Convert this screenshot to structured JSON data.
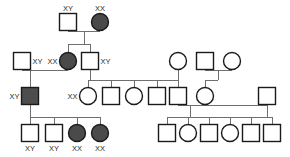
{
  "figure": {
    "kind": "pedigree-chart",
    "width": 290,
    "height": 157,
    "background": "#ffffff",
    "line_color": "#6f6f6f",
    "symbol_outline_color": "#1a1a1a",
    "unaffected_fill": "#ffffff",
    "affected_fill": "#4a4a4a"
  },
  "legend": {
    "square_meaning": "male",
    "circle_meaning": "female",
    "filled_meaning": "affected",
    "open_meaning": "unaffected"
  },
  "generations": [
    {
      "id": "I",
      "individuals": [
        {
          "id": "I-1",
          "shape": "square",
          "sex": "male",
          "affected": false,
          "genotype_label": "XY",
          "label_pos": "above",
          "x": 68,
          "y": 22,
          "size": 17
        },
        {
          "id": "I-2",
          "shape": "circle",
          "sex": "female",
          "affected": true,
          "genotype_label": "XX",
          "label_pos": "above",
          "x": 100,
          "y": 22,
          "size": 17
        }
      ]
    },
    {
      "id": "II",
      "individuals": [
        {
          "id": "II-1",
          "shape": "square",
          "sex": "male",
          "affected": false,
          "genotype_label": "XY",
          "label_pos": "right",
          "x": 22,
          "y": 61,
          "size": 17
        },
        {
          "id": "II-2",
          "shape": "circle",
          "sex": "female",
          "affected": true,
          "genotype_label": "XX",
          "label_pos": "left",
          "x": 68,
          "y": 61,
          "size": 17
        },
        {
          "id": "II-3",
          "shape": "square",
          "sex": "male",
          "affected": false,
          "genotype_label": "XY",
          "label_pos": "right",
          "x": 90,
          "y": 61,
          "size": 17
        },
        {
          "id": "II-4",
          "shape": "circle",
          "sex": "female",
          "affected": false,
          "genotype_label": "",
          "label_pos": "none",
          "x": 178,
          "y": 61,
          "size": 17
        },
        {
          "id": "II-5",
          "shape": "square",
          "sex": "male",
          "affected": false,
          "genotype_label": "",
          "label_pos": "none",
          "x": 205,
          "y": 61,
          "size": 17
        },
        {
          "id": "II-6",
          "shape": "circle",
          "sex": "female",
          "affected": false,
          "genotype_label": "",
          "label_pos": "none",
          "x": 232,
          "y": 61,
          "size": 17
        }
      ]
    },
    {
      "id": "III",
      "individuals": [
        {
          "id": "III-1",
          "shape": "square",
          "sex": "male",
          "affected": true,
          "genotype_label": "XY",
          "label_pos": "left",
          "x": 30,
          "y": 96,
          "size": 17
        },
        {
          "id": "III-2",
          "shape": "circle",
          "sex": "female",
          "affected": false,
          "genotype_label": "XX",
          "label_pos": "left",
          "x": 88,
          "y": 96,
          "size": 17
        },
        {
          "id": "III-3",
          "shape": "square",
          "sex": "male",
          "affected": false,
          "genotype_label": "",
          "label_pos": "none",
          "x": 111,
          "y": 96,
          "size": 17
        },
        {
          "id": "III-4",
          "shape": "circle",
          "sex": "female",
          "affected": false,
          "genotype_label": "",
          "label_pos": "none",
          "x": 134,
          "y": 96,
          "size": 17
        },
        {
          "id": "III-5",
          "shape": "square",
          "sex": "male",
          "affected": false,
          "genotype_label": "",
          "label_pos": "none",
          "x": 157,
          "y": 96,
          "size": 17
        },
        {
          "id": "III-6",
          "shape": "square",
          "sex": "male",
          "affected": false,
          "genotype_label": "",
          "label_pos": "none",
          "x": 178,
          "y": 96,
          "size": 17
        },
        {
          "id": "III-7",
          "shape": "circle",
          "sex": "female",
          "affected": false,
          "genotype_label": "",
          "label_pos": "none",
          "x": 205,
          "y": 96,
          "size": 17
        },
        {
          "id": "III-8",
          "shape": "square",
          "sex": "male",
          "affected": false,
          "genotype_label": "",
          "label_pos": "none",
          "x": 267,
          "y": 96,
          "size": 17
        }
      ]
    },
    {
      "id": "IV",
      "individuals": [
        {
          "id": "IV-1",
          "shape": "square",
          "sex": "male",
          "affected": false,
          "genotype_label": "XY",
          "label_pos": "below",
          "x": 30,
          "y": 133,
          "size": 17
        },
        {
          "id": "IV-2",
          "shape": "square",
          "sex": "male",
          "affected": false,
          "genotype_label": "XY",
          "label_pos": "below",
          "x": 54,
          "y": 133,
          "size": 17
        },
        {
          "id": "IV-3",
          "shape": "circle",
          "sex": "female",
          "affected": true,
          "genotype_label": "XX",
          "label_pos": "below",
          "x": 77,
          "y": 133,
          "size": 17
        },
        {
          "id": "IV-4",
          "shape": "circle",
          "sex": "female",
          "affected": true,
          "genotype_label": "XX",
          "label_pos": "below",
          "x": 100,
          "y": 133,
          "size": 17
        },
        {
          "id": "IV-5",
          "shape": "square",
          "sex": "male",
          "affected": false,
          "genotype_label": "",
          "label_pos": "none",
          "x": 167,
          "y": 133,
          "size": 17
        },
        {
          "id": "IV-6",
          "shape": "circle",
          "sex": "female",
          "affected": false,
          "genotype_label": "",
          "label_pos": "none",
          "x": 188,
          "y": 133,
          "size": 17
        },
        {
          "id": "IV-7",
          "shape": "square",
          "sex": "male",
          "affected": false,
          "genotype_label": "",
          "label_pos": "none",
          "x": 209,
          "y": 133,
          "size": 17
        },
        {
          "id": "IV-8",
          "shape": "circle",
          "sex": "female",
          "affected": false,
          "genotype_label": "",
          "label_pos": "none",
          "x": 230,
          "y": 133,
          "size": 17
        },
        {
          "id": "IV-9",
          "shape": "square",
          "sex": "male",
          "affected": false,
          "genotype_label": "",
          "label_pos": "none",
          "x": 251,
          "y": 133,
          "size": 17
        },
        {
          "id": "IV-10",
          "shape": "square",
          "sex": "male",
          "affected": false,
          "genotype_label": "",
          "label_pos": "none",
          "x": 272,
          "y": 133,
          "size": 17
        }
      ]
    }
  ],
  "connectors": [
    {
      "id": "mate-I",
      "type": "mating-line",
      "x1": 68,
      "y1": 31,
      "x2": 100,
      "y2": 31
    },
    {
      "id": "desc-I",
      "type": "descent-line",
      "x1": 84,
      "y1": 31,
      "x2": 84,
      "y2": 44
    },
    {
      "id": "sib-I",
      "type": "sibship-bar",
      "x1": 68,
      "y1": 44,
      "x2": 90,
      "y2": 44
    },
    {
      "id": "drop-II-2",
      "type": "drop-line",
      "x1": 68,
      "y1": 44,
      "x2": 68,
      "y2": 53
    },
    {
      "id": "drop-II-3",
      "type": "drop-line",
      "x1": 90,
      "y1": 44,
      "x2": 90,
      "y2": 53
    },
    {
      "id": "mate-II-left",
      "type": "mating-line",
      "x1": 22,
      "y1": 70,
      "x2": 68,
      "y2": 70
    },
    {
      "id": "desc-II-left",
      "type": "descent-line",
      "x1": 30,
      "y1": 70,
      "x2": 30,
      "y2": 88
    },
    {
      "id": "mate-II-right",
      "type": "mating-line",
      "x1": 90,
      "y1": 70,
      "x2": 157,
      "y2": 70
    },
    {
      "id": "sib-II-right",
      "type": "sibship-bar",
      "x1": 88,
      "y1": 80,
      "x2": 157,
      "y2": 80
    },
    {
      "id": "drop-III-2",
      "type": "drop-line",
      "x1": 88,
      "y1": 80,
      "x2": 88,
      "y2": 88
    },
    {
      "id": "drop-III-3",
      "type": "drop-line",
      "x1": 111,
      "y1": 80,
      "x2": 111,
      "y2": 88
    },
    {
      "id": "drop-III-4",
      "type": "drop-line",
      "x1": 134,
      "y1": 80,
      "x2": 134,
      "y2": 88
    },
    {
      "id": "drop-III-5",
      "type": "drop-line",
      "x1": 157,
      "y1": 80,
      "x2": 157,
      "y2": 88
    },
    {
      "id": "stem-II-4",
      "type": "drop-line",
      "x1": 178,
      "y1": 70,
      "x2": 178,
      "y2": 80
    },
    {
      "id": "mate-II-45",
      "type": "mating-line",
      "x1": 205,
      "y1": 70,
      "x2": 232,
      "y2": 70
    },
    {
      "id": "desc-II-56",
      "type": "descent-line",
      "x1": 205,
      "y1": 70,
      "x2": 205,
      "y2": 88
    },
    {
      "id": "join-III-6",
      "type": "sibship-bar",
      "x1": 157,
      "y1": 80,
      "x2": 178,
      "y2": 80
    },
    {
      "id": "stem-III-6",
      "type": "drop-line",
      "x1": 178,
      "y1": 80,
      "x2": 178,
      "y2": 88
    },
    {
      "id": "mate-III-67",
      "type": "mating-line",
      "x1": 178,
      "y1": 105,
      "x2": 205,
      "y2": 105
    },
    {
      "id": "mate-III-78",
      "type": "mating-line",
      "x1": 205,
      "y1": 105,
      "x2": 267,
      "y2": 105
    },
    {
      "id": "sib-IV-right",
      "type": "sibship-bar",
      "x1": 167,
      "y1": 117,
      "x2": 272,
      "y2": 117
    },
    {
      "id": "desc-IV-right-a",
      "type": "descent-line",
      "x1": 190,
      "y1": 105,
      "x2": 190,
      "y2": 117
    },
    {
      "id": "sib-IV-left",
      "type": "sibship-bar",
      "x1": 30,
      "y1": 117,
      "x2": 100,
      "y2": 117
    },
    {
      "id": "drop-IV-1",
      "type": "drop-line",
      "x1": 30,
      "y1": 117,
      "x2": 30,
      "y2": 125
    },
    {
      "id": "drop-IV-2",
      "type": "drop-line",
      "x1": 54,
      "y1": 117,
      "x2": 54,
      "y2": 125
    },
    {
      "id": "drop-IV-3",
      "type": "drop-line",
      "x1": 77,
      "y1": 117,
      "x2": 77,
      "y2": 125
    },
    {
      "id": "drop-IV-4",
      "type": "drop-line",
      "x1": 100,
      "y1": 117,
      "x2": 100,
      "y2": 125
    },
    {
      "id": "drop-IV-5",
      "type": "drop-line",
      "x1": 167,
      "y1": 117,
      "x2": 167,
      "y2": 125
    },
    {
      "id": "drop-IV-6",
      "type": "drop-line",
      "x1": 188,
      "y1": 117,
      "x2": 188,
      "y2": 125
    },
    {
      "id": "drop-IV-7",
      "type": "drop-line",
      "x1": 209,
      "y1": 117,
      "x2": 209,
      "y2": 125
    },
    {
      "id": "drop-IV-8",
      "type": "drop-line",
      "x1": 230,
      "y1": 117,
      "x2": 230,
      "y2": 125
    },
    {
      "id": "drop-IV-9",
      "type": "drop-line",
      "x1": 251,
      "y1": 117,
      "x2": 251,
      "y2": 125
    },
    {
      "id": "drop-IV-10",
      "type": "drop-line",
      "x1": 272,
      "y1": 117,
      "x2": 272,
      "y2": 125
    },
    {
      "id": "stem-III-1-down",
      "type": "drop-line",
      "x1": 30,
      "y1": 105,
      "x2": 30,
      "y2": 117
    },
    {
      "id": "stem-III-8-down",
      "type": "drop-line",
      "x1": 267,
      "y1": 105,
      "x2": 267,
      "y2": 105
    }
  ]
}
